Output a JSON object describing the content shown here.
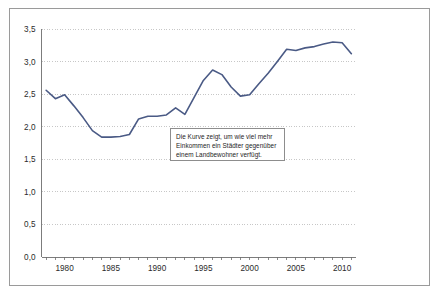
{
  "figure": {
    "background_color": "#ffffff",
    "frame_color": "#9a9a9a"
  },
  "annotation": {
    "text": "Die Kurve zeigt, um wie viel mehr Einkommen ein Städter gegenüber einem Landbewohner verfügt.",
    "border_color": "#8d8d8d",
    "background_color": "#ffffff"
  },
  "chart_data": {
    "type": "line",
    "title": "",
    "subtitle": "",
    "xlabel": "",
    "ylabel": "",
    "xlim": [
      1977.5,
      2011.5
    ],
    "ylim": [
      0.0,
      3.5
    ],
    "grid": true,
    "grid_style": "dotted",
    "grid_color": "#b9b9b9",
    "legend": "none",
    "line_color": "#4a5a85",
    "line_width": 1.6,
    "axis_color": "#6e6e6e",
    "y_ticks": [
      0.0,
      0.5,
      1.0,
      1.5,
      2.0,
      2.5,
      3.0,
      3.5
    ],
    "y_tick_labels": [
      "0,0",
      "0,5",
      "1,0",
      "1,5",
      "2,0",
      "2,5",
      "3,0",
      "3,5"
    ],
    "x_ticks": [
      1978,
      1979,
      1980,
      1981,
      1982,
      1983,
      1984,
      1985,
      1986,
      1987,
      1988,
      1989,
      1990,
      1991,
      1992,
      1993,
      1994,
      1995,
      1996,
      1997,
      1998,
      1999,
      2000,
      2001,
      2002,
      2003,
      2004,
      2005,
      2006,
      2007,
      2008,
      2009,
      2010,
      2011
    ],
    "x_tick_labels_shown": [
      "1980",
      "1985",
      "1990",
      "1995",
      "2000",
      "2005",
      "2010"
    ],
    "x_tick_labels_shown_values": [
      1980,
      1985,
      1990,
      1995,
      2000,
      2005,
      2010
    ],
    "x": [
      1978,
      1979,
      1980,
      1981,
      1982,
      1983,
      1984,
      1985,
      1986,
      1987,
      1988,
      1989,
      1990,
      1991,
      1992,
      1993,
      1994,
      1995,
      1996,
      1997,
      1998,
      1999,
      2000,
      2001,
      2002,
      2003,
      2004,
      2005,
      2006,
      2007,
      2008,
      2009,
      2010,
      2011
    ],
    "values": [
      2.56,
      2.43,
      2.49,
      2.32,
      2.14,
      1.94,
      1.84,
      1.84,
      1.85,
      1.88,
      2.12,
      2.16,
      2.16,
      2.18,
      2.29,
      2.19,
      2.45,
      2.71,
      2.87,
      2.8,
      2.61,
      2.47,
      2.49,
      2.66,
      2.82,
      3.0,
      3.19,
      3.17,
      3.21,
      3.23,
      3.27,
      3.3,
      3.29,
      3.12
    ],
    "series": [
      {
        "name": "Einkommensverhältnis Stadt/Land",
        "values": [
          2.56,
          2.43,
          2.49,
          2.32,
          2.14,
          1.94,
          1.84,
          1.84,
          1.85,
          1.88,
          2.12,
          2.16,
          2.16,
          2.18,
          2.29,
          2.19,
          2.45,
          2.71,
          2.87,
          2.8,
          2.61,
          2.47,
          2.49,
          2.66,
          2.82,
          3.0,
          3.19,
          3.17,
          3.21,
          3.23,
          3.27,
          3.3,
          3.29,
          3.12
        ]
      }
    ]
  }
}
